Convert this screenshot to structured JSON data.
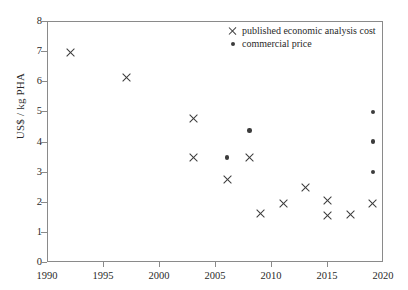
{
  "chart_data": {
    "type": "scatter",
    "title": "",
    "xlabel": "",
    "ylabel": "US$ / kg PHA",
    "xlim": [
      1990,
      2020
    ],
    "ylim": [
      0,
      8
    ],
    "xticks": [
      1990,
      1995,
      2000,
      2005,
      2010,
      2015,
      2020
    ],
    "yticks": [
      0,
      1,
      2,
      3,
      4,
      5,
      6,
      7,
      8
    ],
    "grid": false,
    "legend_position": "top-right",
    "marker_color": "#3c3c3c",
    "axis_color": "#8a8a8a",
    "series": [
      {
        "name": "published economic analysis cost",
        "marker": "x",
        "points": [
          {
            "x": 1992,
            "y": 7.0
          },
          {
            "x": 1997,
            "y": 6.15
          },
          {
            "x": 2003,
            "y": 4.8
          },
          {
            "x": 2003,
            "y": 3.5
          },
          {
            "x": 2006,
            "y": 2.78
          },
          {
            "x": 2008,
            "y": 3.5
          },
          {
            "x": 2009,
            "y": 1.65
          },
          {
            "x": 2011,
            "y": 1.97
          },
          {
            "x": 2013,
            "y": 2.52
          },
          {
            "x": 2015,
            "y": 2.08
          },
          {
            "x": 2015,
            "y": 1.58
          },
          {
            "x": 2017,
            "y": 1.6
          },
          {
            "x": 2019,
            "y": 1.97
          }
        ]
      },
      {
        "name": "commercial price",
        "marker": "dot",
        "points": [
          {
            "x": 2006,
            "y": 3.5
          },
          {
            "x": 2008,
            "y": 4.4
          },
          {
            "x": 2019,
            "y": 5.02
          },
          {
            "x": 2019,
            "y": 4.03
          },
          {
            "x": 2019,
            "y": 3.02
          }
        ]
      }
    ]
  }
}
